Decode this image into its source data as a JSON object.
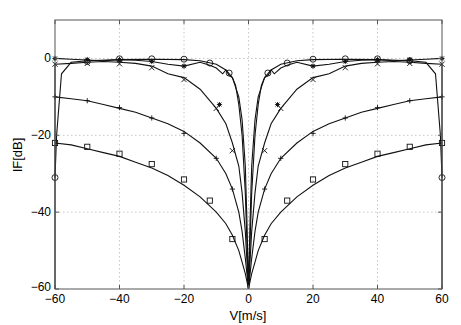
{
  "chart_data": {
    "type": "line",
    "title": "",
    "xlabel": "V[m/s]",
    "ylabel": "IF[dB]",
    "xlim": [
      -60,
      60
    ],
    "ylim": [
      -60,
      10
    ],
    "grid": true,
    "legend": null,
    "x_ticks": [
      -60,
      -40,
      -20,
      0,
      20,
      40,
      60
    ],
    "y_ticks": [
      0,
      -20,
      -40,
      -60
    ],
    "x_tick_labels": [
      "-60",
      "-40",
      "-20",
      "0",
      "20",
      "40",
      "60"
    ],
    "y_tick_labels": [
      "0",
      "-20",
      "-40",
      "-60"
    ],
    "series": [
      {
        "name": "o",
        "marker": "circle",
        "x": [
          -60,
          -59.5,
          -58,
          -55,
          -50,
          -40,
          -30,
          -20,
          -15,
          -10,
          -7,
          -5,
          -3,
          -2,
          -1,
          -0.5,
          0,
          0.5,
          1,
          2,
          3,
          5,
          7,
          10,
          15,
          20,
          30,
          40,
          50,
          55,
          58,
          59.5,
          60
        ],
        "y": [
          -31,
          -20,
          -4,
          -1,
          -0.6,
          -0.3,
          -0.2,
          -0.3,
          -0.6,
          -1.5,
          -3,
          -5,
          -10,
          -16,
          -28,
          -42,
          -60,
          -42,
          -28,
          -16,
          -10,
          -5,
          -3,
          -1.5,
          -0.6,
          -0.3,
          -0.2,
          -0.3,
          -0.6,
          -1,
          -4,
          -20,
          -31
        ],
        "marker_x": [
          -60,
          -50,
          -40,
          -30,
          -20,
          -12,
          -6,
          6,
          12,
          20,
          30,
          40,
          50,
          60
        ],
        "marker_y": [
          -31,
          -0.8,
          -0.1,
          -0.1,
          -0.2,
          -1.2,
          -3.8,
          -3.8,
          -1.2,
          -0.2,
          -0.1,
          -0.1,
          -0.6,
          -31
        ]
      },
      {
        "name": "*",
        "marker": "star",
        "x": [
          -60,
          -55,
          -50,
          -45,
          -40,
          -35,
          -30,
          -25,
          -20,
          -15,
          -12,
          -10,
          -8,
          -7,
          -6,
          -5,
          -4,
          -3,
          -2,
          -1,
          0,
          1,
          2,
          3,
          4,
          5,
          6,
          7,
          8,
          10,
          12,
          15,
          20,
          25,
          30,
          35,
          40,
          45,
          50,
          55,
          60
        ],
        "y": [
          0,
          -0.2,
          -0.4,
          -0.6,
          -0.3,
          -0.5,
          -0.8,
          -1.5,
          -2,
          -1,
          -1.8,
          -2.5,
          -4,
          -3,
          -4.5,
          -5,
          -7,
          -12,
          -20,
          -35,
          -60,
          -35,
          -20,
          -12,
          -7,
          -5,
          -4.5,
          -3,
          -4,
          -2.5,
          -1.8,
          -1,
          -2,
          -1.5,
          -0.8,
          -0.5,
          -0.3,
          -0.6,
          -0.4,
          -0.2,
          0
        ],
        "marker_x": [
          -60,
          -50,
          -40,
          -30,
          -20,
          -9,
          9,
          20,
          30,
          40,
          50,
          60
        ],
        "marker_y": [
          0,
          -0.3,
          -0.3,
          -0.8,
          -2,
          -12,
          -12,
          -2,
          -0.8,
          -0.3,
          -0.3,
          0
        ]
      },
      {
        "name": "x",
        "marker": "x",
        "x": [
          -60,
          -55,
          -50,
          -45,
          -40,
          -35,
          -30,
          -25,
          -20,
          -15,
          -10,
          -7,
          -5,
          -3,
          -2,
          -1,
          0,
          1,
          2,
          3,
          5,
          7,
          10,
          15,
          20,
          25,
          30,
          35,
          40,
          45,
          50,
          55,
          60
        ],
        "y": [
          -1.5,
          -1.3,
          -1,
          -0.8,
          -1,
          -1.3,
          -2,
          -4,
          -5,
          -8,
          -13,
          -17,
          -22,
          -28,
          -35,
          -45,
          -60,
          -45,
          -35,
          -28,
          -22,
          -17,
          -13,
          -8,
          -5,
          -4,
          -2,
          -1.3,
          -1,
          -0.8,
          -1,
          -1.3,
          -1.5
        ],
        "marker_x": [
          -60,
          -50,
          -40,
          -30,
          -20,
          -10,
          -5,
          5,
          10,
          20,
          30,
          40,
          50,
          60
        ],
        "marker_y": [
          -1.5,
          -1.3,
          -1.4,
          -2.4,
          -5.5,
          -13,
          -24,
          -24,
          -13,
          -5.5,
          -2.4,
          -1.4,
          -1.3,
          -1.5
        ],
        "edge_drop": true
      },
      {
        "name": "+",
        "marker": "plus",
        "x": [
          -60,
          -55,
          -50,
          -45,
          -40,
          -35,
          -30,
          -25,
          -20,
          -15,
          -10,
          -7,
          -5,
          -3,
          -2,
          -1,
          0,
          1,
          2,
          3,
          5,
          7,
          10,
          15,
          20,
          25,
          30,
          35,
          40,
          45,
          50,
          55,
          60
        ],
        "y": [
          -10,
          -10.5,
          -11,
          -12,
          -13,
          -14,
          -15.5,
          -17,
          -19,
          -22,
          -26,
          -30,
          -34,
          -40,
          -45,
          -52,
          -60,
          -52,
          -45,
          -40,
          -34,
          -30,
          -26,
          -22,
          -19,
          -17,
          -15.5,
          -14,
          -13,
          -12,
          -11,
          -10.5,
          -10
        ],
        "marker_x": [
          -60,
          -50,
          -40,
          -30,
          -20,
          -10,
          -5,
          5,
          10,
          20,
          30,
          40,
          50,
          60
        ],
        "marker_y": [
          -10,
          -11,
          -12.8,
          -15.5,
          -19.5,
          -26,
          -34,
          -34,
          -26,
          -19.5,
          -15.5,
          -12.8,
          -11,
          -10
        ]
      },
      {
        "name": "square",
        "marker": "square",
        "x": [
          -60,
          -55,
          -50,
          -45,
          -40,
          -35,
          -30,
          -25,
          -20,
          -15,
          -10,
          -7,
          -5,
          -3,
          -2,
          -1,
          0,
          1,
          2,
          3,
          5,
          7,
          10,
          15,
          20,
          25,
          30,
          35,
          40,
          45,
          50,
          55,
          60
        ],
        "y": [
          -22,
          -22.5,
          -23.5,
          -24.5,
          -25.5,
          -27,
          -28.5,
          -30.5,
          -33,
          -36,
          -40,
          -43,
          -46,
          -50,
          -53,
          -56,
          -60,
          -56,
          -53,
          -50,
          -46,
          -43,
          -40,
          -36,
          -33,
          -30.5,
          -28.5,
          -27,
          -25.5,
          -24.5,
          -23.5,
          -22.5,
          -22
        ],
        "marker_x": [
          -60,
          -50,
          -40,
          -30,
          -20,
          -12,
          -5,
          5,
          12,
          20,
          30,
          40,
          50,
          60
        ],
        "marker_y": [
          -22,
          -23,
          -24.8,
          -27.5,
          -31.5,
          -37,
          -47,
          -47,
          -37,
          -31.5,
          -27.5,
          -24.8,
          -23,
          -22
        ]
      }
    ]
  }
}
